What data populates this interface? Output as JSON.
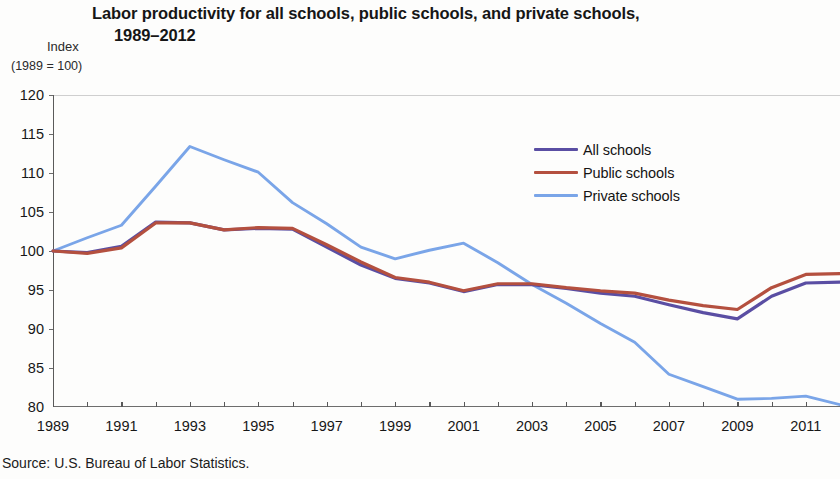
{
  "title": {
    "line1": "Labor productivity for all schools, public schools, and private schools,",
    "line2": "1989–2012"
  },
  "axis_title": {
    "index": "Index",
    "basis": "(1989 = 100)"
  },
  "source": "Source: U.S. Bureau of Labor Statistics.",
  "legend": {
    "items": [
      {
        "label": "All schools",
        "color": "#5a4ea3"
      },
      {
        "label": "Public schools",
        "color": "#b4503f"
      },
      {
        "label": "Private schools",
        "color": "#7aa5e8"
      }
    ]
  },
  "chart_data": {
    "type": "line",
    "title": "Labor productivity for all schools, public schools, and private schools, 1989–2012",
    "xlabel": "",
    "ylabel": "Index (1989 = 100)",
    "xlim": [
      1989,
      2012
    ],
    "ylim": [
      80,
      120
    ],
    "yticks": [
      80,
      85,
      90,
      95,
      100,
      105,
      110,
      115,
      120
    ],
    "xticks": [
      1989,
      1990,
      1991,
      1992,
      1993,
      1994,
      1995,
      1996,
      1997,
      1998,
      1999,
      2000,
      2001,
      2002,
      2003,
      2004,
      2005,
      2006,
      2007,
      2008,
      2009,
      2010,
      2011,
      2012
    ],
    "xtick_labels": [
      1989,
      1991,
      1993,
      1995,
      1997,
      1999,
      2001,
      2003,
      2005,
      2007,
      2009,
      2011
    ],
    "grid": "top-only",
    "legend_position": "upper-right-inside",
    "x": [
      1989,
      1990,
      1991,
      1992,
      1993,
      1994,
      1995,
      1996,
      1997,
      1998,
      1999,
      2000,
      2001,
      2002,
      2003,
      2004,
      2005,
      2006,
      2007,
      2008,
      2009,
      2010,
      2011,
      2012
    ],
    "series": [
      {
        "name": "All schools",
        "color": "#5a4ea3",
        "values": [
          100.0,
          99.8,
          100.6,
          103.7,
          103.6,
          102.7,
          102.9,
          102.8,
          100.5,
          98.2,
          96.5,
          95.9,
          94.8,
          95.7,
          95.7,
          95.2,
          94.6,
          94.2,
          93.1,
          92.1,
          91.3,
          94.2,
          95.9,
          96.0
        ]
      },
      {
        "name": "Public schools",
        "color": "#b4503f",
        "values": [
          100.0,
          99.7,
          100.4,
          103.6,
          103.6,
          102.7,
          103.0,
          102.9,
          100.8,
          98.6,
          96.6,
          96.0,
          94.9,
          95.8,
          95.8,
          95.3,
          94.9,
          94.6,
          93.7,
          93.0,
          92.5,
          95.3,
          97.0,
          97.1
        ]
      },
      {
        "name": "Private schools",
        "color": "#7aa5e8",
        "values": [
          100.0,
          101.7,
          103.3,
          108.3,
          113.4,
          111.7,
          110.1,
          106.2,
          103.5,
          100.5,
          99.0,
          100.1,
          101.0,
          98.5,
          95.7,
          93.3,
          90.7,
          88.3,
          84.2,
          82.6,
          81.0,
          81.1,
          81.4,
          80.3
        ]
      }
    ]
  }
}
